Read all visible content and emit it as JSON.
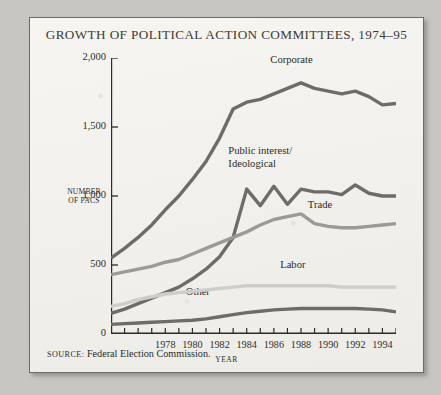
{
  "figure": {
    "title": "GROWTH OF POLITICAL ACTION COMMITTEES, 1974–95",
    "source_prefix": "SOURCE:",
    "source_text": "Federal Election Commission.",
    "background_color": "#f3f2ee",
    "border_color": "#6d6b66"
  },
  "chart_data": {
    "type": "line",
    "title": "GROWTH OF POLITICAL ACTION COMMITTEES, 1974–95",
    "xlabel": "YEAR",
    "ylabel": "NUMBER OF PACS",
    "ylabel_line1": "NUMBER",
    "ylabel_line2": "OF PACS",
    "xlim": [
      1974,
      1995
    ],
    "ylim": [
      0,
      2000
    ],
    "grid": false,
    "legend_position": "inline-labels",
    "y_ticks": [
      0,
      500,
      1000,
      1500,
      2000
    ],
    "y_tick_labels": [
      "0",
      "500",
      "1,000",
      "1,500",
      "2,000"
    ],
    "x_ticks": [
      1974,
      1975,
      1976,
      1977,
      1978,
      1979,
      1980,
      1981,
      1982,
      1983,
      1984,
      1985,
      1986,
      1987,
      1988,
      1989,
      1990,
      1991,
      1992,
      1993,
      1994,
      1995
    ],
    "x_tick_labels": [
      "1978",
      "1980",
      "1982",
      "1984",
      "1986",
      "1988",
      "1990",
      "1992",
      "1994"
    ],
    "x_tick_label_years": [
      1978,
      1980,
      1982,
      1984,
      1986,
      1988,
      1990,
      1992,
      1994
    ],
    "x": [
      1974,
      1975,
      1976,
      1977,
      1978,
      1979,
      1980,
      1981,
      1982,
      1983,
      1984,
      1985,
      1986,
      1987,
      1988,
      1989,
      1990,
      1991,
      1992,
      1993,
      1994,
      1995
    ],
    "series": [
      {
        "name": "Corporate",
        "color": "#6e6c68",
        "label_x": 1987.3,
        "label_y": 1975,
        "values": [
          550,
          620,
          700,
          790,
          900,
          1000,
          1120,
          1250,
          1420,
          1630,
          1680,
          1700,
          1740,
          1780,
          1820,
          1780,
          1760,
          1740,
          1760,
          1720,
          1660,
          1670
        ]
      },
      {
        "name": "Public interest/ Ideological",
        "label_line1": "Public interest/",
        "label_line2": "Ideological",
        "color": "#6e6c68",
        "label_x": 1985.0,
        "label_y": 1320,
        "values": [
          150,
          180,
          220,
          260,
          300,
          340,
          400,
          470,
          560,
          700,
          1050,
          930,
          1070,
          940,
          1050,
          1030,
          1030,
          1010,
          1080,
          1020,
          1000,
          1000
        ]
      },
      {
        "name": "Trade",
        "color": "#9c9a96",
        "label_x": 1989.4,
        "label_y": 930,
        "values": [
          430,
          450,
          470,
          490,
          520,
          540,
          580,
          620,
          660,
          700,
          740,
          790,
          830,
          850,
          870,
          800,
          780,
          770,
          770,
          780,
          790,
          800
        ]
      },
      {
        "name": "Labor",
        "color": "#cfcdc9",
        "label_x": 1987.4,
        "label_y": 490,
        "values": [
          200,
          220,
          250,
          270,
          290,
          300,
          310,
          320,
          330,
          340,
          350,
          350,
          350,
          350,
          350,
          350,
          350,
          340,
          340,
          340,
          340,
          340
        ]
      },
      {
        "name": "Other",
        "color": "#6e6c68",
        "label_x": 1980.4,
        "label_y": 300,
        "values": [
          70,
          75,
          80,
          85,
          90,
          95,
          100,
          110,
          125,
          140,
          155,
          165,
          175,
          180,
          185,
          185,
          185,
          185,
          185,
          180,
          175,
          160
        ]
      }
    ]
  }
}
